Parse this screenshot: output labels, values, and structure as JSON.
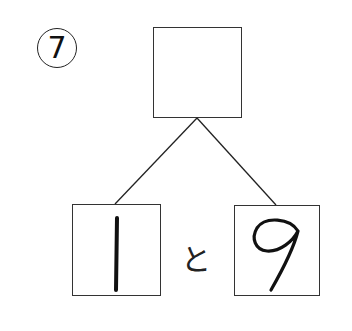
{
  "problem": {
    "number_label": "7",
    "top_box_value": "",
    "left_box_value": "1",
    "right_box_value": "9",
    "connector": "と"
  }
}
